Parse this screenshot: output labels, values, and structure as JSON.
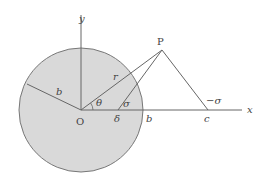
{
  "diagram": {
    "labels": {
      "y_axis": "y",
      "x_axis": "x",
      "origin": "O",
      "point_p": "P",
      "radius_b": "b",
      "radius_r": "r",
      "angle_theta": "θ",
      "angle_sigma": "σ",
      "point_delta": "δ",
      "axis_b": "b",
      "point_c": "c",
      "angle_neg_sigma": "−σ"
    },
    "colors": {
      "disk_fill": "#d9d9d9",
      "stroke": "#666666"
    }
  }
}
